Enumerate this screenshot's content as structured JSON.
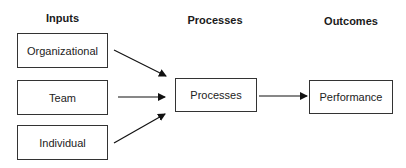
{
  "headings": {
    "inputs": "Inputs",
    "processes": "Processes",
    "outcomes": "Outcomes"
  },
  "inputs": [
    {
      "label": "Organizational"
    },
    {
      "label": "Team"
    },
    {
      "label": "Individual"
    }
  ],
  "process": {
    "label": "Processes"
  },
  "outcome": {
    "label": "Performance"
  },
  "colors": {
    "line": "#111111",
    "border": "#333333",
    "background": "#ffffff"
  }
}
